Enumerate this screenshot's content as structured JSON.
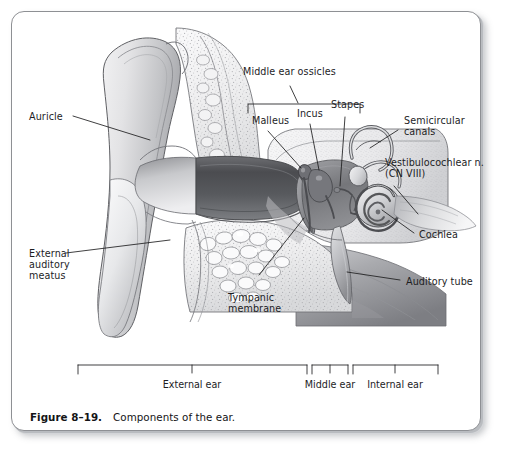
{
  "figure": {
    "caption_number": "Figure 8–19.",
    "caption_text": "Components of the ear.",
    "frame_color": "#8e9094",
    "background": "#ffffff",
    "ink_color": "#1d1d1f"
  },
  "labels": {
    "middle_ear_ossicles": "Middle ear ossicles",
    "malleus": "Malleus",
    "incus": "Incus",
    "stapes": "Stapes",
    "semicircular_canals_line1": "Semicircular",
    "semicircular_canals_line2": "canals",
    "vestibulocochlear_line1": "Vestibulocochlear n.",
    "vestibulocochlear_line2": "(CN VIII)",
    "cochlea": "Cochlea",
    "auditory_tube": "Auditory tube",
    "auricle": "Auricle",
    "external_auditory_meatus_line1": "External",
    "external_auditory_meatus_line2": "auditory",
    "external_auditory_meatus_line3": "meatus",
    "tympanic_membrane_line1": "Tympanic",
    "tympanic_membrane_line2": "membrane"
  },
  "sections": [
    {
      "name": "external-ear",
      "label": "External ear",
      "bracket_left": 78,
      "bracket_right": 307,
      "tick_x": 192
    },
    {
      "name": "middle-ear",
      "label": "Middle ear",
      "bracket_left": 312,
      "bracket_right": 348,
      "tick_x": 330
    },
    {
      "name": "internal-ear",
      "label": "Internal ear",
      "bracket_left": 353,
      "bracket_right": 438,
      "tick_x": 395
    }
  ],
  "ossicles_bracket": {
    "left": 248,
    "right": 360,
    "top": 104,
    "stem_x": 296,
    "stem_top": 88
  },
  "illustration": {
    "name": "coronal-section-of-ear",
    "structures": [
      "auricle",
      "external-auditory-meatus",
      "tympanic-membrane",
      "malleus",
      "incus",
      "stapes",
      "semicircular-canals",
      "cochlea",
      "vestibulocochlear-nerve",
      "auditory-tube",
      "mastoid-air-cells",
      "temporal-bone"
    ]
  }
}
